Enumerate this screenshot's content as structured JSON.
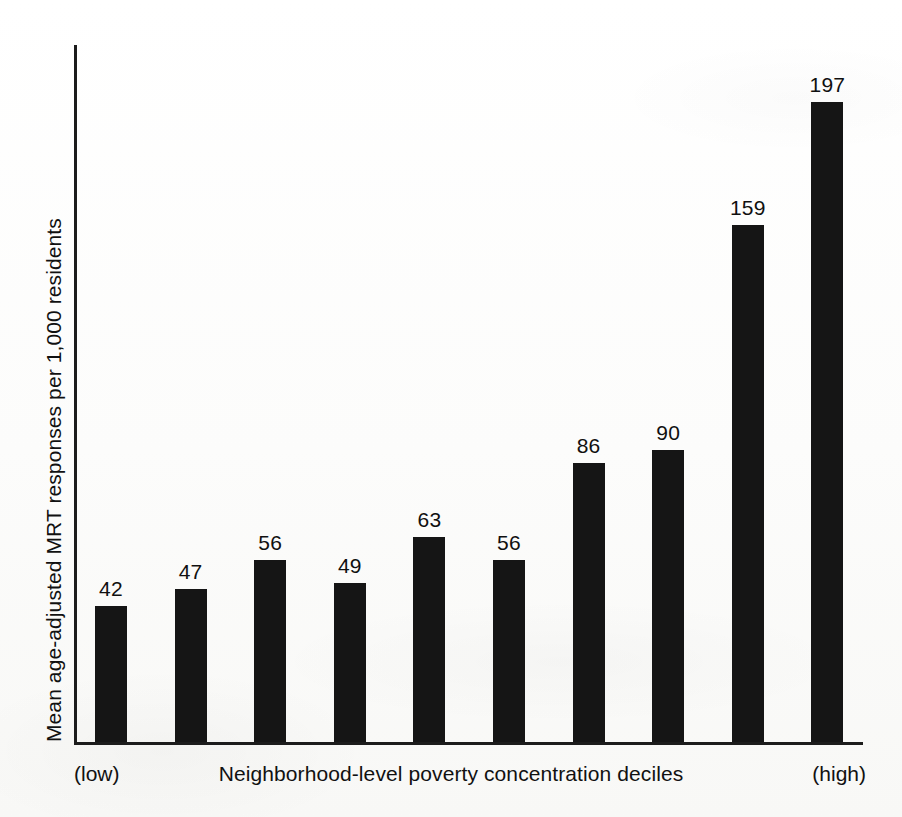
{
  "figure": {
    "background_color": "#fdfdfc",
    "ink_color": "#151515"
  },
  "chart_data": {
    "type": "bar",
    "title": "",
    "subtitle": "",
    "xlabel": "Neighborhood-level poverty concentration deciles",
    "ylabel": "Mean age-adjusted MRT responses per 1,000 residents",
    "categories": [
      "1",
      "2",
      "3",
      "4",
      "5",
      "6",
      "7",
      "8",
      "9",
      "10"
    ],
    "values": [
      42,
      47,
      56,
      49,
      63,
      56,
      86,
      90,
      159,
      197
    ],
    "data_labels": [
      "42",
      "47",
      "56",
      "49",
      "63",
      "56",
      "86",
      "90",
      "159",
      "197"
    ],
    "x_axis_endpoint_labels": {
      "left": "(low)",
      "right": "(high)"
    },
    "ylim": [
      0,
      197
    ],
    "xlim": [
      0,
      10
    ],
    "grid": false,
    "legend": false,
    "legend_position": "none",
    "y_tick_labels": [],
    "x_tick_labels": [],
    "bar_color": "#151515",
    "axis_color": "#1c1c1c"
  }
}
